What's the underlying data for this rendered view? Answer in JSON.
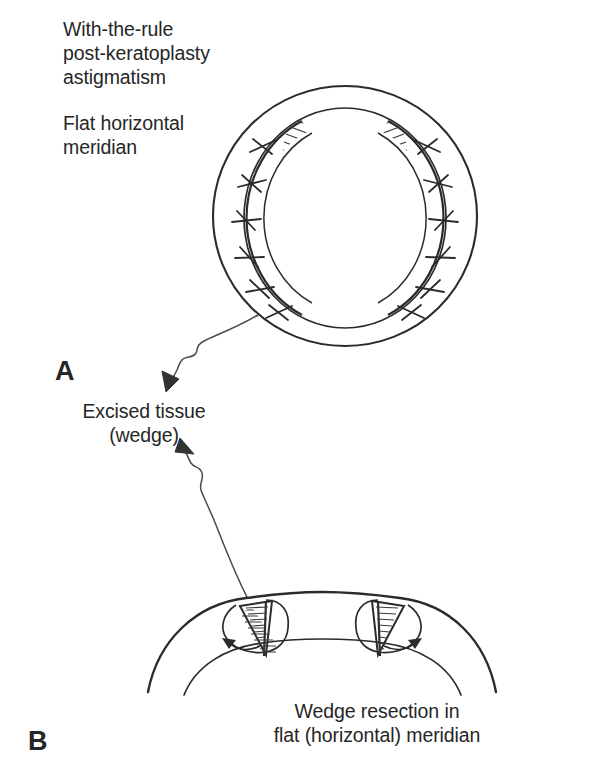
{
  "figure": {
    "title_lines": "With-the-rule\npost-keratoplasty\nastigmatism",
    "meridian_lines": "Flat horizontal\nmeridian",
    "excised_lines": "Excised tissue\n(wedge)",
    "caption_lines": "Wedge resection in\nflat (horizontal) meridian",
    "panel_a_letter": "A",
    "panel_b_letter": "B"
  },
  "colors": {
    "ink": "#262626",
    "line": "#2b2b2b",
    "background": "#ffffff",
    "hatch": "#3a3a3a"
  },
  "panel_a": {
    "name": "en-face corneal graft view",
    "limbus_circle": {
      "cx": 345,
      "cy": 216,
      "r": 131
    },
    "graft_circle": {
      "cx": 345,
      "cy": 218,
      "rx": 101,
      "ry": 110
    },
    "wedge_description": "hatched crescent wedges at nasal and temporal (horizontal) meridian",
    "sutures_per_side": 6,
    "suture_shape": "x-cross"
  },
  "panel_b": {
    "name": "cross-section of cornea in flat horizontal meridian",
    "outer_arc": {
      "cx": 322,
      "cy": 880,
      "r": 282
    },
    "inner_arc": {
      "cx": 322,
      "cy": 900,
      "r": 245
    },
    "wedges": 2,
    "arrow_description": "curved approximation arrows at each wedge"
  },
  "connectors": [
    {
      "name": "arrow-graft-to-excised",
      "from": "panel-a wedge",
      "to": "excised tissue label"
    },
    {
      "name": "arrow-section-to-wedge",
      "from": "panel-b wedge",
      "to": "wedge label"
    }
  ]
}
